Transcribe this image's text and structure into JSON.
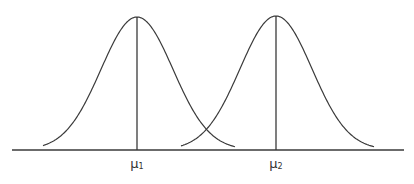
{
  "diagram": {
    "type": "two-overlapping-normal-distributions",
    "stroke_color": "#3a3a3a",
    "background": "#ffffff",
    "baseline": {
      "x1": 12,
      "x2": 404,
      "y": 150
    },
    "curves": [
      {
        "name": "distribution-1",
        "mean_label": "μ",
        "mean_subscript": "1",
        "peak_x": 137,
        "peak_y": 17,
        "sigma_px": 36,
        "x_start": 43,
        "x_end": 235
      },
      {
        "name": "distribution-2",
        "mean_label": "μ",
        "mean_subscript": "2",
        "peak_x": 276,
        "peak_y": 16,
        "sigma_px": 36,
        "x_start": 181,
        "x_end": 374
      }
    ],
    "labels": [
      {
        "symbol": "μ",
        "subscript": "1",
        "x": 137,
        "y": 157
      },
      {
        "symbol": "μ",
        "subscript": "2",
        "x": 276,
        "y": 157
      }
    ]
  }
}
